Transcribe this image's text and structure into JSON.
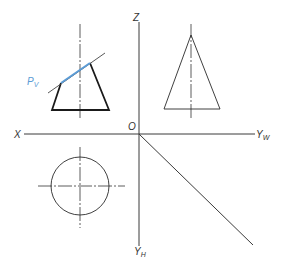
{
  "diagram": {
    "type": "orthographic-projection",
    "colors": {
      "line": "#1a1a1a",
      "axis": "#3a3a3a",
      "plane_trace": "#5b9bd5"
    },
    "axes": {
      "x_label": "X",
      "z_label": "Z",
      "origin_label": "O",
      "yw_label": "Y",
      "yw_sub": "W",
      "yh_label": "Y",
      "yh_sub": "H"
    },
    "front_view": {
      "shape": "frustum-cut-by-plane",
      "plane_label": "P",
      "plane_sub": "V"
    },
    "side_view": {
      "shape": "triangle-cone"
    },
    "top_view": {
      "shape": "circle"
    }
  }
}
